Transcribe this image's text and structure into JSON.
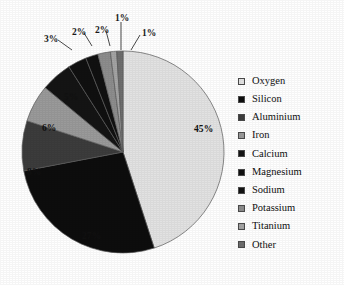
{
  "chart_data": {
    "type": "pie",
    "title": "",
    "xlabel": "",
    "ylabel": "",
    "unit": "%",
    "legend_position": "right",
    "start_angle_deg": 0,
    "direction": "clockwise",
    "categories": [
      "Oxygen",
      "Silicon",
      "Aluminium",
      "Iron",
      "Calcium",
      "Magnesium",
      "Sodium",
      "Potassium",
      "Titanium",
      "Other"
    ],
    "values": [
      45,
      27,
      8,
      6,
      5,
      3,
      2,
      2,
      1,
      1
    ],
    "labels": [
      "45%",
      "27%",
      "8%",
      "6%",
      "5%",
      "3%",
      "2%",
      "2%",
      "1%",
      "1%"
    ],
    "colors": [
      "#e2e2e2",
      "#0d0d0d",
      "#3c3c3c",
      "#9a9a9a",
      "#141414",
      "#101010",
      "#111111",
      "#8d8d8d",
      "#a4a4a4",
      "#6e6e6e"
    ],
    "slices": [
      {
        "name": "Oxygen",
        "value": 45,
        "label": "45%",
        "color": "#e2e2e2",
        "label_inside": true
      },
      {
        "name": "Silicon",
        "value": 27,
        "label": "27%",
        "color": "#0d0d0d",
        "label_inside": true
      },
      {
        "name": "Aluminium",
        "value": 8,
        "label": "8%",
        "color": "#3c3c3c",
        "label_inside": true
      },
      {
        "name": "Iron",
        "value": 6,
        "label": "6%",
        "color": "#9a9a9a",
        "label_inside": true
      },
      {
        "name": "Calcium",
        "value": 5,
        "label": "5%",
        "color": "#141414",
        "label_inside": true
      },
      {
        "name": "Magnesium",
        "value": 3,
        "label": "3%",
        "color": "#101010",
        "label_inside": false
      },
      {
        "name": "Sodium",
        "value": 2,
        "label": "2%",
        "color": "#111111",
        "label_inside": false
      },
      {
        "name": "Potassium",
        "value": 2,
        "label": "2%",
        "color": "#8d8d8d",
        "label_inside": false
      },
      {
        "name": "Titanium",
        "value": 1,
        "label": "1%",
        "color": "#a4a4a4",
        "label_inside": false
      },
      {
        "name": "Other",
        "value": 1,
        "label": "1%",
        "color": "#6e6e6e",
        "label_inside": false
      }
    ]
  },
  "legend": {
    "items": [
      {
        "label": "Oxygen",
        "color": "#e2e2e2"
      },
      {
        "label": "Silicon",
        "color": "#0d0d0d"
      },
      {
        "label": "Aluminium",
        "color": "#3c3c3c"
      },
      {
        "label": "Iron",
        "color": "#9a9a9a"
      },
      {
        "label": "Calcium",
        "color": "#141414"
      },
      {
        "label": "Magnesium",
        "color": "#101010"
      },
      {
        "label": "Sodium",
        "color": "#111111"
      },
      {
        "label": "Potassium",
        "color": "#8d8d8d"
      },
      {
        "label": "Titanium",
        "color": "#a4a4a4"
      },
      {
        "label": "Other",
        "color": "#6e6e6e"
      }
    ]
  },
  "callouts": [
    {
      "label": "3%",
      "x": 44,
      "y": 35
    },
    {
      "label": "2%",
      "x": 72,
      "y": 28
    },
    {
      "label": "2%",
      "x": 95,
      "y": 26
    },
    {
      "label": "1%",
      "x": 115,
      "y": 14
    },
    {
      "label": "1%",
      "x": 142,
      "y": 29
    }
  ],
  "inside_labels": [
    {
      "label": "45%",
      "x": 194,
      "y": 125
    },
    {
      "label": "27%",
      "x": 82,
      "y": 232
    },
    {
      "label": "8%",
      "x": 27,
      "y": 168
    },
    {
      "label": "6%",
      "x": 42,
      "y": 124
    },
    {
      "label": "5%",
      "x": 64,
      "y": 93
    }
  ]
}
